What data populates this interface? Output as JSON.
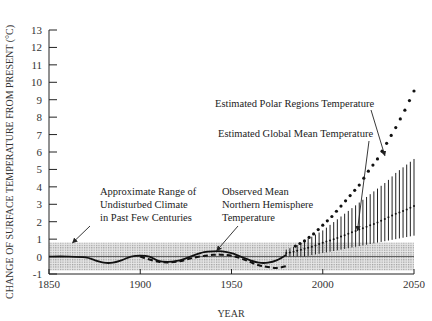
{
  "chart_data": {
    "type": "line",
    "title": "",
    "xlabel": "YEAR",
    "ylabel": "CHANGE OF SURFACE TEMPERATURE FROM PRESENT (°C)",
    "xlim": [
      1850,
      2050
    ],
    "ylim": [
      -1,
      13
    ],
    "x_ticks": [
      1850,
      1900,
      1950,
      2000,
      2050
    ],
    "y_ticks": [
      -1,
      0,
      1,
      2,
      3,
      4,
      5,
      6,
      7,
      8,
      9,
      10,
      11,
      12,
      13
    ],
    "grid": false,
    "legend": null,
    "shaded_band": {
      "name": "Approximate Range of Undisturbed Climate in Past Few Centuries",
      "ymin": -0.8,
      "ymax": 0.8,
      "x_range": [
        1850,
        2050
      ]
    },
    "reference_line": {
      "y": 0
    },
    "series": [
      {
        "name": "Observed Mean Northern Hemisphere Temperature",
        "style": "solid",
        "x": [
          1850,
          1860,
          1870,
          1875,
          1880,
          1885,
          1890,
          1895,
          1900,
          1905,
          1910,
          1915,
          1920,
          1925,
          1930,
          1935,
          1940,
          1945,
          1950,
          1955,
          1960,
          1965,
          1970,
          1975,
          1980
        ],
        "values": [
          0.0,
          0.0,
          -0.05,
          -0.2,
          -0.35,
          -0.35,
          -0.2,
          0.0,
          0.05,
          0.0,
          -0.25,
          -0.3,
          -0.25,
          -0.1,
          0.1,
          0.25,
          0.3,
          0.3,
          0.2,
          0.0,
          -0.2,
          -0.35,
          -0.35,
          -0.2,
          0.1
        ]
      },
      {
        "name": "Observed Mean Northern Hemisphere Temperature (alternate, dashed)",
        "style": "dashed",
        "x": [
          1900,
          1910,
          1920,
          1930,
          1940,
          1945,
          1950,
          1955,
          1960,
          1965,
          1970,
          1975,
          1980
        ],
        "values": [
          0.0,
          -0.3,
          -0.3,
          -0.05,
          0.1,
          0.1,
          0.05,
          -0.1,
          -0.3,
          -0.5,
          -0.6,
          -0.65,
          -0.55
        ]
      },
      {
        "name": "Estimated Global Mean Temperature",
        "style": "dotted-center-with-range-bars",
        "x": [
          1980,
          1985,
          1990,
          1995,
          2000,
          2005,
          2010,
          2015,
          2020,
          2025,
          2030,
          2035,
          2040,
          2045,
          2050
        ],
        "values": [
          0.2,
          0.3,
          0.45,
          0.6,
          0.8,
          0.95,
          1.15,
          1.35,
          1.55,
          1.75,
          1.95,
          2.2,
          2.45,
          2.65,
          2.9
        ],
        "range_low": [
          0.0,
          0.0,
          0.0,
          0.1,
          0.2,
          0.3,
          0.4,
          0.5,
          0.6,
          0.7,
          0.8,
          0.9,
          1.0,
          1.1,
          1.2
        ],
        "range_high": [
          0.4,
          0.6,
          0.9,
          1.2,
          1.5,
          1.9,
          2.3,
          2.7,
          3.1,
          3.5,
          3.9,
          4.3,
          4.8,
          5.2,
          5.6
        ]
      },
      {
        "name": "Estimated Polar Regions Temperature",
        "style": "dotted",
        "x": [
          1985,
          1990,
          1995,
          2000,
          2005,
          2010,
          2015,
          2020,
          2025,
          2030,
          2035,
          2040,
          2045,
          2050
        ],
        "values": [
          0.6,
          0.9,
          1.3,
          1.8,
          2.3,
          2.9,
          3.5,
          4.1,
          4.9,
          5.6,
          6.5,
          7.4,
          8.4,
          9.5
        ]
      }
    ],
    "annotations": [
      {
        "text": [
          "Estimated Polar Regions Temperature"
        ],
        "arrow_to": [
          2034,
          5.8
        ]
      },
      {
        "text": [
          "Estimated Global Mean Temperature"
        ],
        "arrow_to": [
          2019,
          1.5
        ]
      },
      {
        "text": [
          "Approximate Range of",
          "Undisturbed Climate",
          "in Past Few Centuries"
        ],
        "arrow_to": [
          1863,
          0.8
        ]
      },
      {
        "text": [
          "Observed Mean",
          "Northern Hemisphere",
          "Temperature"
        ],
        "arrow_to": [
          1942,
          0.35
        ]
      }
    ]
  },
  "labels": {
    "xlabel": "YEAR",
    "ylabel": "CHANGE OF SURFACE TEMPERATURE FROM PRESENT (°C)"
  }
}
